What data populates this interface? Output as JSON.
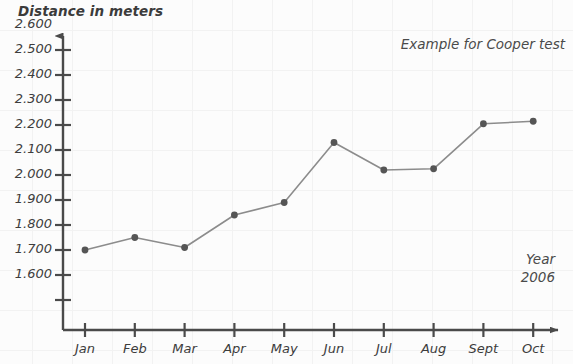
{
  "chart_data": {
    "type": "line",
    "title": "Example for Cooper test",
    "ylabel": "Distance in meters",
    "xlabel": "",
    "categories": [
      "Jan",
      "Feb",
      "Mar",
      "Apr",
      "May",
      "Jun",
      "Jul",
      "Aug",
      "Sept",
      "Oct"
    ],
    "values": [
      1700,
      1750,
      1710,
      1840,
      1890,
      2130,
      2020,
      2025,
      2205,
      2215
    ],
    "series": [
      {
        "name": "Distance in meters",
        "values": [
          1700,
          1750,
          1710,
          1840,
          1890,
          2130,
          2020,
          2025,
          2205,
          2215
        ]
      }
    ],
    "ylim": [
      1500,
      2650
    ],
    "y_ticks": [
      1600,
      1700,
      1800,
      1900,
      2000,
      2100,
      2200,
      2300,
      2400,
      2500,
      2600
    ],
    "y_tick_labels": [
      "1.600",
      "1.700",
      "1.800",
      "1.900",
      "2.000",
      "2.100",
      "2.200",
      "2.300",
      "2.400",
      "2.500",
      "2.600"
    ],
    "grid": true,
    "legend": "none",
    "annotations": [
      {
        "text": "Example for Cooper test",
        "position": "top-right"
      },
      {
        "text": "Year",
        "position": "bottom-right"
      },
      {
        "text": "2006",
        "position": "bottom-right"
      }
    ],
    "line_color": "#8c8c8c",
    "marker_color": "#555555",
    "axis_color": "#4a4a4a"
  },
  "axis": {
    "y_title": "Distance in meters",
    "x_axis_name": "months-axis",
    "y_axis_name": "distance-axis"
  },
  "annotations": {
    "example_label": "Example for Cooper test",
    "year_word": "Year",
    "year_value": "2006"
  }
}
